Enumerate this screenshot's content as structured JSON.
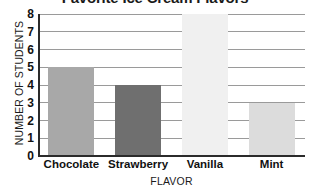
{
  "chart_data": {
    "type": "bar",
    "title": "Favorite Ice Cream Flavors",
    "xlabel": "FLAVOR",
    "ylabel": "NUMBER OF STUDENTS",
    "categories": [
      "Chocolate",
      "Strawberry",
      "Vanilla",
      "Mint"
    ],
    "values": [
      5,
      4,
      8,
      3
    ],
    "ylim": [
      0,
      8
    ],
    "ytick_labels": [
      "0",
      "1",
      "2",
      "3",
      "4",
      "5",
      "6",
      "7",
      "8"
    ],
    "ytick_values": [
      0,
      1,
      2,
      3,
      4,
      5,
      6,
      7,
      8
    ],
    "grid": true,
    "grid_axis": "y",
    "legend": false,
    "bar_colors": [
      "#a8a8a8",
      "#6f6f6f",
      "#f0f0f0",
      "#dcdcdc"
    ],
    "grid_color": "#9a9a9a",
    "axis_color": "#2b2b2b",
    "background_color": "#ffffff",
    "text_color": "#1a1a1a",
    "title_clipped": true
  }
}
